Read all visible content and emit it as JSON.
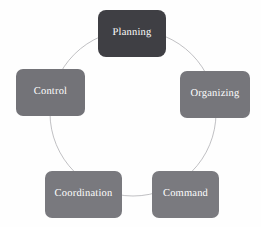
{
  "diagram": {
    "type": "cycle",
    "title": "",
    "background_color": "#fefefe",
    "arc": {
      "name": "cycle-arc",
      "stroke_color": "#b9b9bc",
      "stroke_width": 0.9,
      "center_x": 133,
      "center_y": 113,
      "radius": 83
    },
    "nodes": [
      {
        "id": "planning",
        "label": "Planning",
        "position": "top",
        "fill_color": "#3f3f44",
        "text_color": "#ffffff"
      },
      {
        "id": "organizing",
        "label": "Organizing",
        "position": "right",
        "fill_color": "#76767b",
        "text_color": "#ffffff"
      },
      {
        "id": "command",
        "label": "Command",
        "position": "bottom-right",
        "fill_color": "#7a7a7f",
        "text_color": "#ffffff"
      },
      {
        "id": "coordination",
        "label": "Coordination",
        "position": "bottom-left",
        "fill_color": "#79797e",
        "text_color": "#ffffff"
      },
      {
        "id": "control",
        "label": "Control",
        "position": "left",
        "fill_color": "#737378",
        "text_color": "#ffffff"
      }
    ]
  }
}
